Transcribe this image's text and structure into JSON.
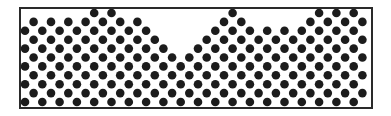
{
  "figure": {
    "frame": {
      "x": 20,
      "y": 8,
      "width": 352,
      "height": 100,
      "stroke": "#2a2a2a",
      "stroke_width": 2
    },
    "circle": {
      "radius": 4.3,
      "fill": "#1c1c1c"
    },
    "lattice": {
      "x0": 25,
      "dx": 8.65,
      "y_bottom": 102,
      "dy": 8.9,
      "rows": 11,
      "columns": 41
    },
    "surface_top_row_by_column": [
      9,
      9,
      9,
      9,
      9,
      9,
      9,
      10,
      10,
      10,
      10,
      9,
      9,
      9,
      8,
      8,
      7,
      6,
      5,
      6,
      7,
      8,
      9,
      10,
      10,
      10,
      9,
      8,
      8,
      7,
      8,
      8,
      9,
      9,
      10,
      10,
      10,
      10,
      10,
      9,
      9
    ]
  }
}
